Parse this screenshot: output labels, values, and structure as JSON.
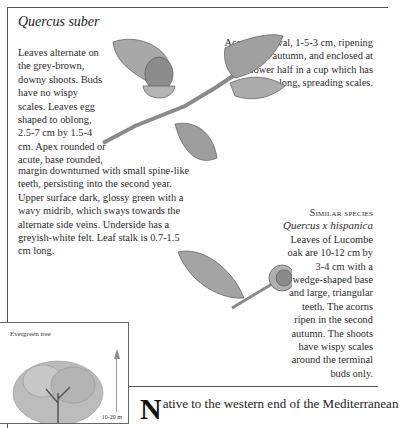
{
  "page": {
    "title": "Quercus suber",
    "left_text_narrow": "Leaves alternate on the grey-brown, downy shoots. Buds have no wispy scales. Leaves egg shaped to oblong, 2.5-7 cm by 1.5-4 cm. Apex rounded or acute, base rounded,",
    "left_text_wide": "margin downturned with small spine-like teeth, persisting into the second year. Upper surface dark, glossy green with a wavy midrib, which sways towards the alternate side veins. Underside has a  greyish-white felt. Leaf stalk is 0.7-1.5 cm long.",
    "right_text": "Acorns are oval, 1-5-3 cm, ripening in the first autumn, and enclosed at the lower half in a cup which has long, spreading scales.",
    "similar_species": {
      "heading": "Similar species",
      "name": "Quercus x hispanica",
      "body": "Leaves of Lucombe oak are 10-12 cm by 3-4 cm with a wedge-shaped base and large, triangular teeth. The acorns ripen in the second autumn. The shoots have wispy scales around the terminal buds only."
    },
    "tree_box": {
      "label": "Evergreen tree",
      "height": "10-20 m"
    },
    "intro": {
      "dropcap": "N",
      "text": "ative to the western end of the Mediterranean"
    }
  },
  "illustrations": {
    "main": "oak-branch-with-acorn",
    "similar": "lucombe-oak-leaf-and-acorn",
    "tree": "cork-oak-tree-silhouette"
  }
}
